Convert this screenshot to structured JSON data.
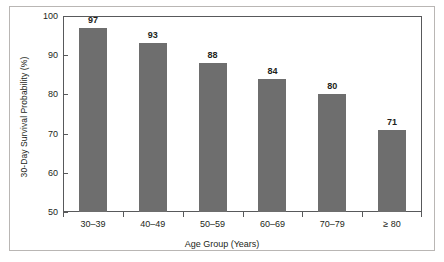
{
  "chart_data": {
    "type": "bar",
    "title": "",
    "xlabel": "Age Group (Years)",
    "ylabel": "30-Day Survival Probability (%)",
    "categories": [
      "30–39",
      "40–49",
      "50–59",
      "60–69",
      "70–79",
      "≥ 80"
    ],
    "values": [
      97,
      93,
      88,
      84,
      80,
      71
    ],
    "value_labels": [
      "97",
      "93",
      "88",
      "84",
      "80",
      "71"
    ],
    "ylim": [
      50,
      100
    ],
    "yticks": [
      50,
      60,
      70,
      80,
      90,
      100
    ],
    "ytick_labels": [
      "50",
      "60",
      "70",
      "80",
      "90",
      "100"
    ],
    "grid": false,
    "legend": null,
    "bar_color": "#6e6e6e",
    "axis_color": "#58595b",
    "frame_color": "#b9b6b4",
    "background": "#ffffff"
  }
}
